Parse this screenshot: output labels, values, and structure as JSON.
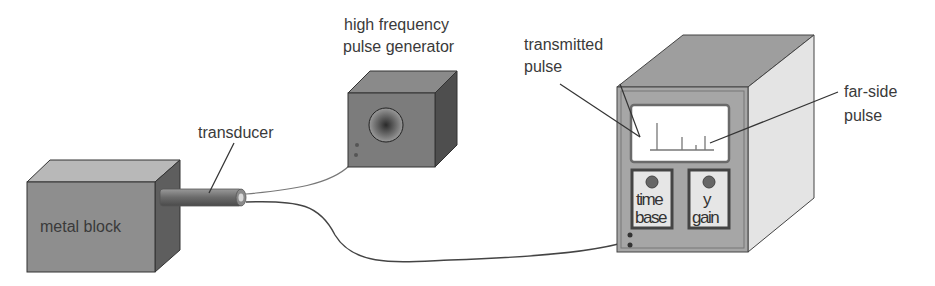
{
  "diagram": {
    "labels": {
      "metal_block": "metal block",
      "transducer": "transducer",
      "pulse_generator_line1": "high frequency",
      "pulse_generator_line2": "pulse generator",
      "transmitted_line1": "transmitted",
      "transmitted_line2": "pulse",
      "farside_line1": "far-side",
      "farside_line2": "pulse"
    },
    "controls": {
      "time_base_line1": "time",
      "time_base_line2": "base",
      "y_gain_line1": "y",
      "y_gain_line2": "gain"
    },
    "colors": {
      "block_front": "#8e8e8e",
      "block_top": "#b5b5b5",
      "block_side": "#5e5e5e",
      "cro_front": "#a8a8a8",
      "cro_top": "#9a9a9a",
      "cro_side": "#e2e2e2",
      "screen": "#ffffff",
      "cable": "#555555"
    }
  }
}
